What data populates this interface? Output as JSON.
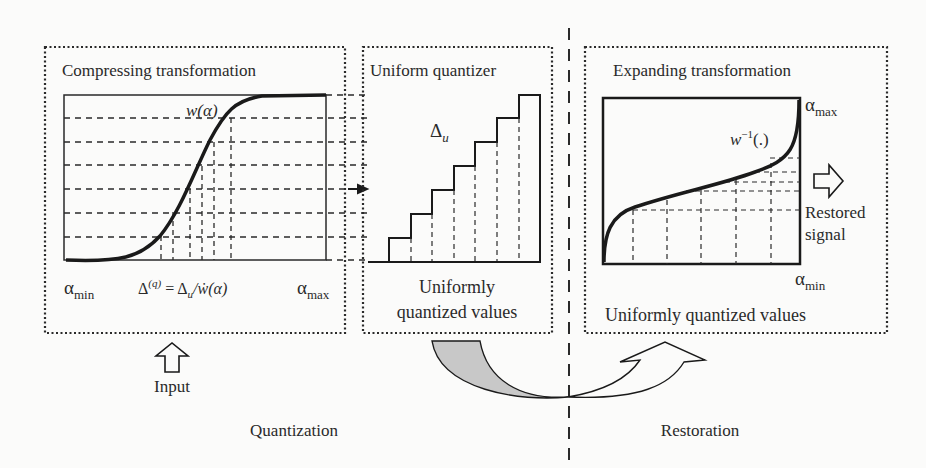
{
  "diagram": {
    "panels": {
      "compress": {
        "title": "Compressing transformation",
        "curve_label": "w(α)",
        "x_min_label": "α",
        "x_min_sub": "min",
        "x_max_label": "α",
        "x_max_sub": "max",
        "formula_main": "Δ",
        "formula_sup": "(q)",
        "formula_rest": " = Δ",
        "formula_sub_u": "u",
        "formula_tail": "/ẇ(α)"
      },
      "quantizer": {
        "title": "Uniform quantizer",
        "step_label": "Δ",
        "step_sub": "u",
        "caption_line1": "Uniformly",
        "caption_line2": "quantized values"
      },
      "expand": {
        "title": "Expanding transformation",
        "curve_label": "w",
        "curve_sup": "−1",
        "curve_tail": "(.)",
        "y_max_label": "α",
        "y_max_sub": "max",
        "y_min_label": "α",
        "y_min_sub": "min",
        "output_line1": "Restored",
        "output_line2": "signal",
        "caption": "Uniformly quantized values"
      }
    },
    "input_label": "Input",
    "stage_left": "Quantization",
    "stage_right": "Restoration",
    "colors": {
      "ink": "#2a2a2a",
      "arrow_fill_gray": "#c8c8c8",
      "background": "#fbfbfa"
    }
  }
}
